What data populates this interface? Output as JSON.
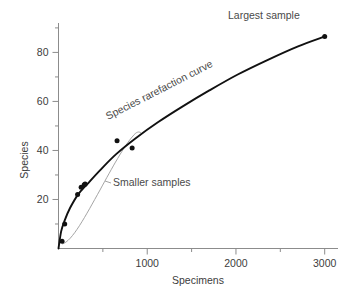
{
  "chart_data": {
    "type": "line",
    "title": "",
    "xlabel": "Specimens",
    "ylabel": "Species",
    "xlim": [
      0,
      3150
    ],
    "ylim": [
      0,
      92
    ],
    "grid": false,
    "legend": null,
    "x_ticks_major": [
      1000,
      2000,
      3000
    ],
    "x_tick_labels": [
      "1000",
      "2000",
      "3000"
    ],
    "x_ticks_minor": [
      500,
      1500,
      2500
    ],
    "y_ticks_major": [
      20,
      40,
      60,
      80
    ],
    "y_tick_labels": [
      "20",
      "40",
      "60",
      "80"
    ],
    "y_ticks_minor": [
      10,
      30,
      50,
      70,
      90
    ],
    "series": [
      {
        "name": "Species rarefaction curve",
        "type": "line",
        "color": "#111111",
        "x": [
          0,
          30,
          70,
          130,
          220,
          330,
          470,
          650,
          870,
          1120,
          1400,
          1700,
          2020,
          2360,
          2700,
          3000
        ],
        "y": [
          0,
          7.0,
          11.5,
          16.5,
          22.0,
          26.5,
          32.0,
          38.5,
          45.0,
          51.5,
          58.0,
          64.5,
          71.0,
          77.0,
          82.5,
          86.5
        ]
      },
      {
        "name": "sample points",
        "type": "scatter",
        "color": "#111111",
        "points": [
          {
            "x": 40,
            "y": 3.0
          },
          {
            "x": 70,
            "y": 10.0
          },
          {
            "x": 215,
            "y": 22.0
          },
          {
            "x": 255,
            "y": 25.0
          },
          {
            "x": 290,
            "y": 26.0
          },
          {
            "x": 300,
            "y": 26.3
          },
          {
            "x": 660,
            "y": 44.0
          },
          {
            "x": 830,
            "y": 41.0
          },
          {
            "x": 3000,
            "y": 86.5
          }
        ]
      }
    ],
    "annotations": [
      {
        "name": "largest-sample-label",
        "text": "Largest sample",
        "x": 2300,
        "y": 91
      },
      {
        "name": "curve-label",
        "text": "Species rarefaction curve",
        "x": 900,
        "y": 52,
        "rotation": -27
      },
      {
        "name": "smaller-samples-label",
        "text": "Smaller samples",
        "x": 1020,
        "y": 22
      }
    ]
  },
  "axes": {
    "x_title": "Specimens",
    "y_title": "Species"
  },
  "labels": {
    "largest_sample": "Largest sample",
    "curve_name": "Species rarefaction curve",
    "smaller_samples": "Smaller samples"
  },
  "colors": {
    "curve": "#111111",
    "axis": "#8c8c8c",
    "text": "#3c3c3c",
    "annotation": "#4a4a4a",
    "bracket": "#9a9a9a",
    "background": "#ffffff"
  }
}
